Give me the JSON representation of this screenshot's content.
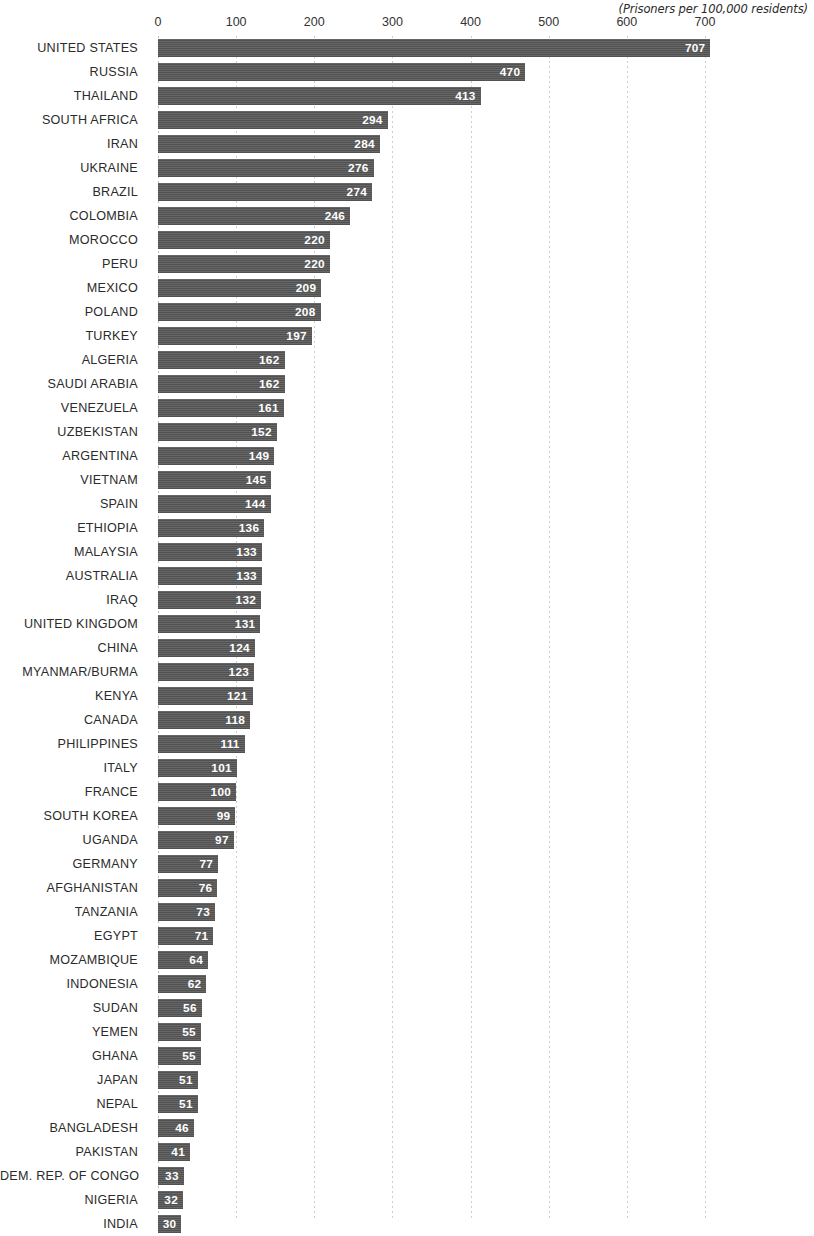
{
  "chart_data": {
    "type": "bar",
    "orientation": "horizontal",
    "title": "",
    "subtitle": "(Prisoners per 100,000 residents)",
    "xlabel": "",
    "ylabel": "",
    "xlim": [
      0,
      700
    ],
    "xticks": [
      0,
      100,
      200,
      300,
      400,
      500,
      600,
      700
    ],
    "xtick_labels": [
      "0",
      "100",
      "200",
      "300",
      "400",
      "500",
      "600",
      "700"
    ],
    "grid": true,
    "grid_axis": "x",
    "legend": null,
    "bar_color": "#565656",
    "value_label_color": "#ffffff",
    "categories": [
      "UNITED STATES",
      "RUSSIA",
      "THAILAND",
      "SOUTH AFRICA",
      "IRAN",
      "UKRAINE",
      "BRAZIL",
      "COLOMBIA",
      "MOROCCO",
      "PERU",
      "MEXICO",
      "POLAND",
      "TURKEY",
      "ALGERIA",
      "SAUDI ARABIA",
      "VENEZUELA",
      "UZBEKISTAN",
      "ARGENTINA",
      "VIETNAM",
      "SPAIN",
      "ETHIOPIA",
      "MALAYSIA",
      "AUSTRALIA",
      "IRAQ",
      "UNITED KINGDOM",
      "CHINA",
      "MYANMAR/BURMA",
      "KENYA",
      "CANADA",
      "PHILIPPINES",
      "ITALY",
      "FRANCE",
      "SOUTH KOREA",
      "UGANDA",
      "GERMANY",
      "AFGHANISTAN",
      "TANZANIA",
      "EGYPT",
      "MOZAMBIQUE",
      "INDONESIA",
      "SUDAN",
      "YEMEN",
      "GHANA",
      "JAPAN",
      "NEPAL",
      "BANGLADESH",
      "PAKISTAN",
      "DEM. REP. OF CONGO",
      "NIGERIA",
      "INDIA"
    ],
    "values": [
      707,
      470,
      413,
      294,
      284,
      276,
      274,
      246,
      220,
      220,
      209,
      208,
      197,
      162,
      162,
      161,
      152,
      149,
      145,
      144,
      136,
      133,
      133,
      132,
      131,
      124,
      123,
      121,
      118,
      111,
      101,
      100,
      99,
      97,
      77,
      76,
      73,
      71,
      64,
      62,
      56,
      55,
      55,
      51,
      51,
      46,
      41,
      33,
      32,
      30
    ]
  }
}
